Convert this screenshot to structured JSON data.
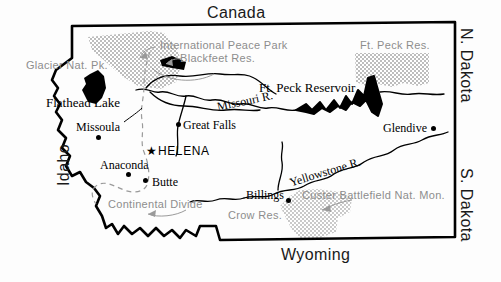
{
  "map": {
    "title": "Montana",
    "colors": {
      "border": "#000000",
      "water": "#000000",
      "reservation_fill": "#c9c9c9",
      "label_grey": "#8d8d8d",
      "label_black": "#000000",
      "background": "#fdfdfd"
    },
    "neighbors": [
      {
        "name": "Canada",
        "label": "Canada"
      },
      {
        "name": "N. Dakota",
        "label": "N. Dakota"
      },
      {
        "name": "S. Dakota",
        "label": "S. Dakota"
      },
      {
        "name": "Wyoming",
        "label": "Wyoming"
      },
      {
        "name": "Idaho",
        "label": "Idaho"
      }
    ],
    "cities": [
      {
        "name": "Missoula",
        "label": "Missoula"
      },
      {
        "name": "Great Falls",
        "label": "Great Falls"
      },
      {
        "name": "Glendive",
        "label": "Glendive"
      },
      {
        "name": "Anaconda",
        "label": "Anaconda"
      },
      {
        "name": "Butte",
        "label": "Butte"
      },
      {
        "name": "Billings",
        "label": "Billings"
      }
    ],
    "capital": {
      "name": "Helena",
      "label": "HELENA",
      "marker": "star"
    },
    "water_features": [
      {
        "name": "Flathead Lake",
        "label": "Flathead Lake"
      },
      {
        "name": "Ft. Peck Reservoir",
        "label": "Ft. Peck Reservoir"
      },
      {
        "name": "Missouri River",
        "label": "Missouri R."
      },
      {
        "name": "Yellowstone River",
        "label": "Yellowstone R."
      }
    ],
    "protected_areas": [
      {
        "name": "Glacier National Park",
        "label": "Glacier Nat. Pk."
      },
      {
        "name": "International Peace Park",
        "label": "International Peace Park"
      },
      {
        "name": "Blackfeet Reservation",
        "label": "Blackfeet Res."
      },
      {
        "name": "Ft. Peck Reservation",
        "label": "Ft. Peck Res."
      },
      {
        "name": "Crow Reservation",
        "label": "Crow Res."
      },
      {
        "name": "Custer Battlefield National Monument",
        "label": "Custer Battlefield Nat. Mon."
      }
    ],
    "divide": {
      "name": "Continental Divide",
      "label": "Continental Divide"
    }
  }
}
